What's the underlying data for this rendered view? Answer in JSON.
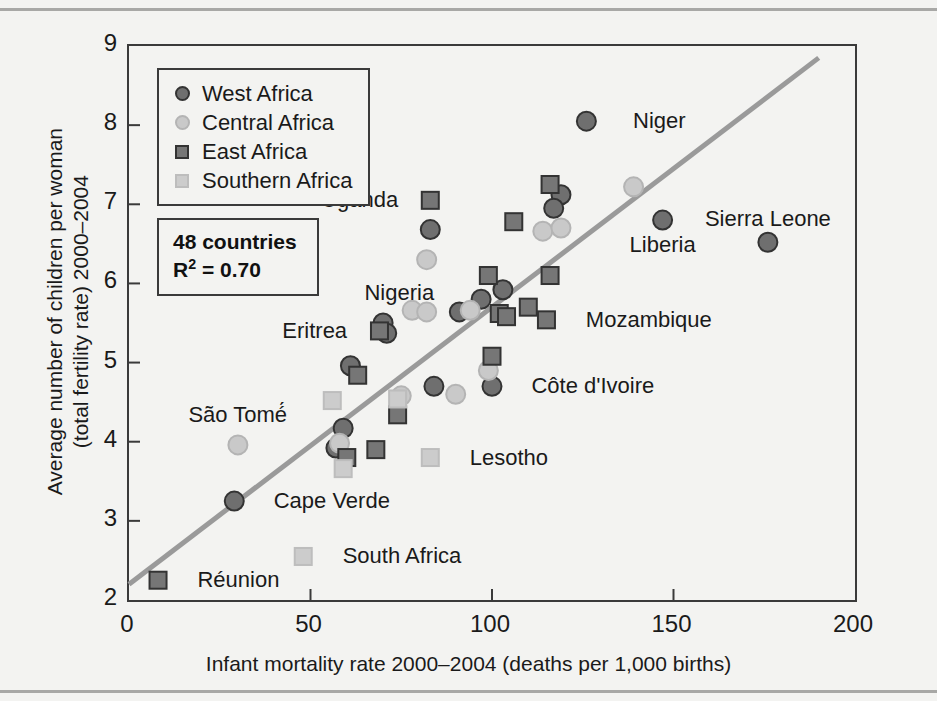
{
  "chart_data": {
    "type": "scatter",
    "title": "",
    "xlabel": "Infant mortality rate 2000–2004 (deaths per 1,000 births)",
    "ylabel": "Average number of children per woman (total fertility rate) 2000–2004",
    "ylabel_line1": "Average number of children per woman",
    "ylabel_line2": "(total fertility rate) 2000–2004",
    "xlim": [
      0,
      200
    ],
    "ylim": [
      2,
      9
    ],
    "xticks": [
      0,
      50,
      100,
      150,
      200
    ],
    "yticks": [
      2,
      3,
      4,
      5,
      6,
      7,
      8,
      9
    ],
    "grid": false,
    "legend_position": "top-left",
    "n_countries": 48,
    "r_squared": 0.7,
    "annotation_countries_label": "48 countries",
    "annotation_r2_label": "R2 = 0.70",
    "trendline": {
      "x0": 0,
      "y0": 2.2,
      "x1": 190,
      "y1": 8.85,
      "color": "#9a9a9a"
    },
    "series": [
      {
        "name": "West Africa",
        "marker": "circle",
        "color": "#6f6f6f",
        "edge": "#333333"
      },
      {
        "name": "Central Africa",
        "marker": "circle",
        "color": "#c9c9c9",
        "edge": "#b4b4b4"
      },
      {
        "name": "East Africa",
        "marker": "square",
        "color": "#767676",
        "edge": "#333333"
      },
      {
        "name": "Southern Africa",
        "marker": "square",
        "color": "#cccccc",
        "edge": "#bdbdbd"
      }
    ],
    "points": [
      {
        "x": 126,
        "y": 8.05,
        "group": "West Africa",
        "label": "Niger"
      },
      {
        "x": 176,
        "y": 6.52,
        "group": "West Africa",
        "label": "Sierra Leone"
      },
      {
        "x": 147,
        "y": 6.8,
        "group": "West Africa",
        "label": "Liberia"
      },
      {
        "x": 100,
        "y": 4.7,
        "group": "West Africa",
        "label": "Côte d'Ivoire"
      },
      {
        "x": 29,
        "y": 3.25,
        "group": "West Africa",
        "label": "Cape Verde"
      },
      {
        "x": 83,
        "y": 6.68,
        "group": "West Africa",
        "label": ""
      },
      {
        "x": 119,
        "y": 7.12,
        "group": "West Africa",
        "label": ""
      },
      {
        "x": 117,
        "y": 6.95,
        "group": "West Africa",
        "label": ""
      },
      {
        "x": 97,
        "y": 5.8,
        "group": "West Africa",
        "label": ""
      },
      {
        "x": 103,
        "y": 5.92,
        "group": "West Africa",
        "label": ""
      },
      {
        "x": 91,
        "y": 5.64,
        "group": "West Africa",
        "label": ""
      },
      {
        "x": 70,
        "y": 5.5,
        "group": "West Africa",
        "label": ""
      },
      {
        "x": 71,
        "y": 5.37,
        "group": "West Africa",
        "label": ""
      },
      {
        "x": 61,
        "y": 4.96,
        "group": "West Africa",
        "label": ""
      },
      {
        "x": 84,
        "y": 4.7,
        "group": "West Africa",
        "label": ""
      },
      {
        "x": 59,
        "y": 4.17,
        "group": "West Africa",
        "label": ""
      },
      {
        "x": 57,
        "y": 3.92,
        "group": "West Africa",
        "label": ""
      },
      {
        "x": 139,
        "y": 7.22,
        "group": "Central Africa",
        "label": ""
      },
      {
        "x": 114,
        "y": 6.66,
        "group": "Central Africa",
        "label": ""
      },
      {
        "x": 119,
        "y": 6.7,
        "group": "Central Africa",
        "label": ""
      },
      {
        "x": 82,
        "y": 6.3,
        "group": "Central Africa",
        "label": ""
      },
      {
        "x": 78,
        "y": 5.66,
        "group": "Central Africa",
        "label": ""
      },
      {
        "x": 82,
        "y": 5.64,
        "group": "Central Africa",
        "label": ""
      },
      {
        "x": 94,
        "y": 5.66,
        "group": "Central Africa",
        "label": ""
      },
      {
        "x": 99,
        "y": 4.9,
        "group": "Central Africa",
        "label": ""
      },
      {
        "x": 90,
        "y": 4.6,
        "group": "Central Africa",
        "label": ""
      },
      {
        "x": 75,
        "y": 4.58,
        "group": "Central Africa",
        "label": ""
      },
      {
        "x": 58,
        "y": 3.98,
        "group": "Central Africa",
        "label": ""
      },
      {
        "x": 30,
        "y": 3.96,
        "group": "Central Africa",
        "label": "São Tomé"
      },
      {
        "x": 83,
        "y": 7.05,
        "group": "East Africa",
        "label": "Uganda"
      },
      {
        "x": 116,
        "y": 7.25,
        "group": "East Africa",
        "label": ""
      },
      {
        "x": 106,
        "y": 6.78,
        "group": "East Africa",
        "label": ""
      },
      {
        "x": 116,
        "y": 6.1,
        "group": "East Africa",
        "label": ""
      },
      {
        "x": 99,
        "y": 6.1,
        "group": "East Africa",
        "label": ""
      },
      {
        "x": 110,
        "y": 5.7,
        "group": "East Africa",
        "label": ""
      },
      {
        "x": 102,
        "y": 5.62,
        "group": "East Africa",
        "label": ""
      },
      {
        "x": 104,
        "y": 5.58,
        "group": "East Africa",
        "label": ""
      },
      {
        "x": 115,
        "y": 5.54,
        "group": "East Africa",
        "label": "Mozambique"
      },
      {
        "x": 69,
        "y": 5.4,
        "group": "East Africa",
        "label": "Eritrea"
      },
      {
        "x": 100,
        "y": 5.08,
        "group": "East Africa",
        "label": ""
      },
      {
        "x": 63,
        "y": 4.84,
        "group": "East Africa",
        "label": ""
      },
      {
        "x": 74,
        "y": 4.34,
        "group": "East Africa",
        "label": ""
      },
      {
        "x": 68,
        "y": 3.9,
        "group": "East Africa",
        "label": ""
      },
      {
        "x": 60,
        "y": 3.8,
        "group": "East Africa",
        "label": ""
      },
      {
        "x": 8,
        "y": 2.25,
        "group": "East Africa",
        "label": "Réunion"
      },
      {
        "x": 74,
        "y": 4.54,
        "group": "Southern Africa",
        "label": ""
      },
      {
        "x": 56,
        "y": 4.52,
        "group": "Southern Africa",
        "label": ""
      },
      {
        "x": 59,
        "y": 3.66,
        "group": "Southern Africa",
        "label": ""
      },
      {
        "x": 83,
        "y": 3.8,
        "group": "Southern Africa",
        "label": "Lesotho"
      },
      {
        "x": 48,
        "y": 2.55,
        "group": "Southern Africa",
        "label": "South Africa"
      }
    ],
    "point_labels": [
      {
        "text": "Niger",
        "x": 135,
        "y": 8.05,
        "anchor": "left"
      },
      {
        "text": "Sierra Leone",
        "x": 176,
        "y": 6.82,
        "anchor": "center"
      },
      {
        "text": "Liberia",
        "x": 147,
        "y": 6.48,
        "anchor": "center"
      },
      {
        "text": "Mozambique",
        "x": 122,
        "y": 5.54,
        "anchor": "left"
      },
      {
        "text": "Uganda",
        "x": 78,
        "y": 7.05,
        "anchor": "right"
      },
      {
        "text": "Nigeria",
        "x": 88,
        "y": 5.88,
        "anchor": "right"
      },
      {
        "text": "Eritrea",
        "x": 64,
        "y": 5.4,
        "anchor": "right"
      },
      {
        "text": "Côte d'Ivoire",
        "x": 107,
        "y": 4.7,
        "anchor": "left"
      },
      {
        "text": "São Tomé́",
        "x": 30,
        "y": 4.34,
        "anchor": "center"
      },
      {
        "text": "Lesotho",
        "x": 90,
        "y": 3.8,
        "anchor": "left"
      },
      {
        "text": "Cape Verde",
        "x": 36,
        "y": 3.25,
        "anchor": "left"
      },
      {
        "text": "South Africa",
        "x": 55,
        "y": 2.55,
        "anchor": "left"
      },
      {
        "text": "Réunion",
        "x": 15,
        "y": 2.25,
        "anchor": "left"
      }
    ]
  },
  "legend": {
    "items": [
      {
        "label": "West Africa"
      },
      {
        "label": "Central Africa"
      },
      {
        "label": "East Africa"
      },
      {
        "label": "Southern Africa"
      }
    ]
  },
  "stats": {
    "countries": "48 countries",
    "r2_prefix": "R",
    "r2_sup": "2",
    "r2_value": " = 0.70"
  }
}
